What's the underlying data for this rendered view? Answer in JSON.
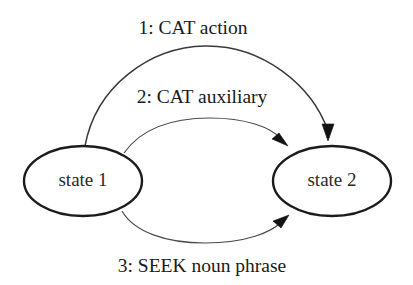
{
  "figure": {
    "background_color": "#ffffff",
    "line_color": "#1c1c1c",
    "text_color": "#1a1a1a"
  },
  "states": [
    {
      "id": "state1",
      "label": "state 1",
      "cx": 83,
      "cy": 181,
      "rx": 59,
      "ry": 35
    },
    {
      "id": "state2",
      "label": "state 2",
      "cx": 332,
      "cy": 181,
      "rx": 59,
      "ry": 35
    }
  ],
  "transitions": [
    {
      "id": "t1",
      "label": "1: CAT action",
      "from": "state 1",
      "to": "state 2",
      "label_x": 193,
      "label_y": 34
    },
    {
      "id": "t2",
      "label": "2: CAT auxiliary",
      "from": "state 1",
      "to": "state 2",
      "label_x": 202,
      "label_y": 103
    },
    {
      "id": "t3",
      "label": "3: SEEK noun phrase",
      "from": "state 1",
      "to": "state 2",
      "label_x": 202,
      "label_y": 272
    }
  ]
}
